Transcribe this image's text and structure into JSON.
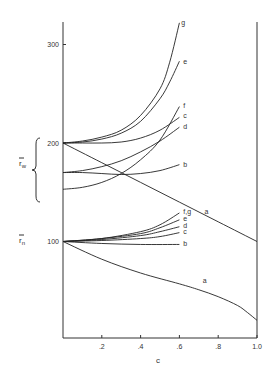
{
  "chart_data": {
    "type": "line",
    "title": "",
    "xlabel": "c",
    "ylabel": "",
    "xlim": [
      0,
      1.0
    ],
    "ylim": [
      0,
      330
    ],
    "grid": false,
    "legend": "none (curves labeled inline a–g)",
    "x_ticks": [
      ".2",
      ".4",
      ".6",
      ".8",
      "1.0"
    ],
    "x_tick_values": [
      0.2,
      0.4,
      0.6,
      0.8,
      1.0
    ],
    "y_ticks": [
      "100",
      "200",
      "300"
    ],
    "y_tick_values": [
      100,
      200,
      300
    ],
    "group_labels": [
      {
        "text": "r̄w",
        "sub": "w",
        "base": "r̄",
        "y_range": [
          150,
          205
        ],
        "description": "brace grouping weight-average curves"
      },
      {
        "text": "r̄n",
        "sub": "n",
        "base": "r̄",
        "y": 100,
        "description": "number-average curves"
      }
    ],
    "series": [
      {
        "group": "rw",
        "name": "a",
        "x": [
          0,
          0.2,
          0.4,
          0.6,
          0.8,
          1.0
        ],
        "y": [
          200,
          180,
          160,
          140,
          120,
          100
        ],
        "label_pos": [
          0.73,
          130
        ]
      },
      {
        "group": "rw",
        "name": "b",
        "x": [
          0,
          0.1,
          0.2,
          0.3,
          0.4,
          0.5,
          0.6
        ],
        "y": [
          170,
          170,
          169,
          168,
          169,
          172,
          178
        ],
        "label_pos": [
          0.62,
          178
        ]
      },
      {
        "group": "rw",
        "name": "c",
        "x": [
          0,
          0.1,
          0.2,
          0.3,
          0.4,
          0.5,
          0.6
        ],
        "y": [
          200,
          200,
          200,
          201,
          205,
          213,
          226
        ],
        "label_pos": [
          0.62,
          227
        ]
      },
      {
        "group": "rw",
        "name": "d",
        "x": [
          0,
          0.1,
          0.2,
          0.3,
          0.4,
          0.5,
          0.6
        ],
        "y": [
          170,
          172,
          176,
          182,
          191,
          202,
          216
        ],
        "label_pos": [
          0.62,
          216
        ]
      },
      {
        "group": "rw",
        "name": "e",
        "x": [
          0,
          0.1,
          0.2,
          0.3,
          0.4,
          0.5,
          0.55,
          0.6
        ],
        "y": [
          200,
          201,
          204,
          210,
          222,
          245,
          262,
          283
        ],
        "label_pos": [
          0.62,
          282
        ]
      },
      {
        "group": "rw",
        "name": "f",
        "x": [
          0,
          0.1,
          0.2,
          0.3,
          0.4,
          0.5,
          0.6
        ],
        "y": [
          153,
          155,
          160,
          169,
          183,
          203,
          237
        ],
        "label_pos": [
          0.62,
          238
        ]
      },
      {
        "group": "rw",
        "name": "g",
        "x": [
          0,
          0.1,
          0.2,
          0.3,
          0.4,
          0.5,
          0.55,
          0.6
        ],
        "y": [
          200,
          202,
          206,
          213,
          228,
          255,
          282,
          322
        ],
        "label_pos": [
          0.61,
          322
        ]
      },
      {
        "group": "rn",
        "name": "a",
        "x": [
          0,
          0.2,
          0.4,
          0.6,
          0.7,
          0.8,
          0.9,
          0.95,
          1.0
        ],
        "y": [
          100,
          82,
          68,
          57,
          51,
          44,
          35,
          28,
          20
        ],
        "label_pos": [
          0.72,
          60
        ]
      },
      {
        "group": "rn",
        "name": "b",
        "x": [
          0,
          0.2,
          0.4,
          0.6
        ],
        "y": [
          100,
          98,
          97,
          97
        ],
        "label_pos": [
          0.62,
          97
        ]
      },
      {
        "group": "rn",
        "name": "c",
        "x": [
          0,
          0.2,
          0.4,
          0.5,
          0.6
        ],
        "y": [
          100,
          101,
          103,
          105,
          109
        ],
        "label_pos": [
          0.62,
          110
        ]
      },
      {
        "group": "rn",
        "name": "d",
        "x": [
          0,
          0.2,
          0.4,
          0.5,
          0.6
        ],
        "y": [
          100,
          102,
          106,
          110,
          115
        ],
        "label_pos": [
          0.62,
          116
        ]
      },
      {
        "group": "rn",
        "name": "e",
        "x": [
          0,
          0.2,
          0.4,
          0.5,
          0.6
        ],
        "y": [
          100,
          103,
          108,
          114,
          122
        ],
        "label_pos": [
          0.62,
          123
        ]
      },
      {
        "group": "rn",
        "name": "f,g",
        "x": [
          0,
          0.2,
          0.4,
          0.5,
          0.6
        ],
        "y": [
          100,
          103,
          110,
          117,
          129
        ],
        "label_pos": [
          0.62,
          130
        ]
      }
    ]
  }
}
